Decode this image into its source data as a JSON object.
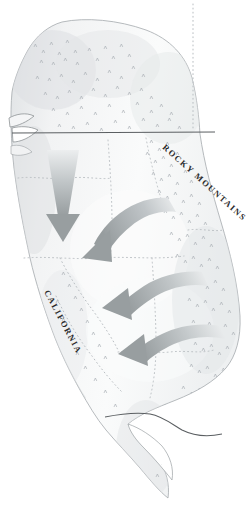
{
  "figure": {
    "kind": "map-illustration",
    "title_visible": false,
    "width_px": 250,
    "height_px": 510,
    "background_color": "#ffffff",
    "region": "Western North America",
    "projection_note": "oblique shaded-relief sketch"
  },
  "labels": [
    {
      "id": "rocky-mountains",
      "text": "ROCKY MOUNTAINS",
      "style": "spaced small caps",
      "rotation_deg": 42,
      "x": 162,
      "y": 148,
      "font_size_px": 8.5,
      "color": "#2b2b2b"
    },
    {
      "id": "california",
      "text": "CALIFORNIA",
      "style": "spaced small caps",
      "rotation_deg": 62,
      "x": 44,
      "y": 292,
      "font_size_px": 8.5,
      "color": "#2b2b2b"
    }
  ],
  "arrows": [
    {
      "id": "arrow-1",
      "description": "straight southward arrow over Washington and Oregon",
      "direction": "south",
      "tip": {
        "x": 63,
        "y": 240
      },
      "tail": {
        "x": 63,
        "y": 152
      },
      "curved": false,
      "color": "#9aa0a2"
    },
    {
      "id": "arrow-2",
      "description": "curved arrow sweeping west off the Rockies into the Great Basin",
      "direction": "southwest",
      "tip": {
        "x": 86,
        "y": 258
      },
      "tail": {
        "x": 176,
        "y": 206
      },
      "curved": true,
      "color": "#9aa0a2"
    },
    {
      "id": "arrow-3",
      "description": "curved arrow sweeping west into central Nevada",
      "direction": "west",
      "tip": {
        "x": 105,
        "y": 306
      },
      "tail": {
        "x": 196,
        "y": 282
      },
      "curved": true,
      "color": "#9aa0a2"
    },
    {
      "id": "arrow-4",
      "description": "curved arrow sweeping west into the southwest deserts",
      "direction": "west",
      "tip": {
        "x": 123,
        "y": 352
      },
      "tail": {
        "x": 214,
        "y": 336
      },
      "curved": true,
      "color": "#9aa0a2"
    }
  ],
  "boundaries": {
    "international": [
      {
        "id": "us-canada-border",
        "text_note": "49th parallel",
        "style": "solid thin dark line",
        "color": "#5b5f62"
      },
      {
        "id": "us-mexico-border",
        "text_note": "southern border",
        "style": "solid thin dark line",
        "color": "#5b5f62"
      }
    ],
    "state": {
      "style": "fine dotted lines",
      "color": "#b9bec2",
      "count": 9
    }
  },
  "terrain": {
    "relief_shading_color": "#d9dcde",
    "land_fill_color": "#f7f8f8",
    "coast_line_color": "#9fa4a7",
    "mountain_hatch_color": "#b4b9bd",
    "mountain_hatch_note": "tiny chevron hachures denote Rocky Mountain and Coast Range ranges"
  },
  "palette": {
    "background": "#ffffff",
    "land": "#f7f8f8",
    "relief": "#d9dcde",
    "arrow_gray": "#9aa0a2",
    "arrow_gray_light": "#e4e7e8",
    "border_dark": "#5b5f62",
    "dotted_gray": "#b9bec2",
    "label_text": "#2b2b2b"
  }
}
